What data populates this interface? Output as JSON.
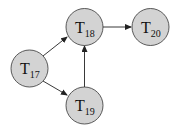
{
  "diagram": {
    "type": "directed-graph",
    "nodes": [
      {
        "id": "T17",
        "letter": "T",
        "sub": "17",
        "cx": 29.5,
        "cy": 68.5
      },
      {
        "id": "T18",
        "letter": "T",
        "sub": "18",
        "cx": 84.5,
        "cy": 27
      },
      {
        "id": "T19",
        "letter": "T",
        "sub": "19",
        "cx": 84.5,
        "cy": 105.5
      },
      {
        "id": "T20",
        "letter": "T",
        "sub": "20",
        "cx": 150.5,
        "cy": 27
      }
    ],
    "edges": [
      {
        "from": "T17",
        "to": "T18"
      },
      {
        "from": "T17",
        "to": "T19"
      },
      {
        "from": "T19",
        "to": "T18"
      },
      {
        "from": "T18",
        "to": "T20"
      }
    ],
    "colors": {
      "node_fill": "#d3d3d3",
      "node_stroke": "#333333",
      "edge": "#222222"
    }
  }
}
